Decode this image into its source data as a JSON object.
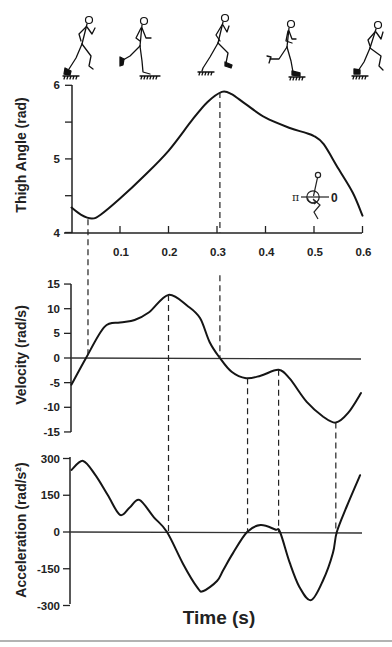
{
  "figure": {
    "xlabel": "Time (s)",
    "inset_icon": {
      "name": "thigh-angle-convention-icon",
      "left_label": "π",
      "right_label": "0"
    },
    "runner_phases": [
      "runner-phase-1",
      "runner-phase-2",
      "runner-phase-3",
      "runner-phase-4",
      "runner-phase-5"
    ]
  },
  "chart_data": [
    {
      "id": "thigh_angle",
      "type": "line",
      "title": "",
      "xlabel": "Time (s)",
      "ylabel": "Thigh Angle (rad)",
      "xlim": [
        0,
        0.6
      ],
      "ylim": [
        4,
        6
      ],
      "xticks": [
        "0.1",
        "0.2",
        "0.3",
        "0.4",
        "0.5",
        "0.6"
      ],
      "xtick_values": [
        0.1,
        0.2,
        0.3,
        0.4,
        0.5,
        0.6
      ],
      "yticks": [
        "6",
        "5",
        "4"
      ],
      "ytick_values": [
        6,
        5,
        4
      ],
      "yminor_values": [
        5.5,
        4.5
      ],
      "grid": false,
      "zero_line": false,
      "series": [
        {
          "name": "Thigh Angle",
          "x": [
            0,
            0.02,
            0.042,
            0.06,
            0.1,
            0.15,
            0.2,
            0.25,
            0.28,
            0.31,
            0.33,
            0.36,
            0.4,
            0.45,
            0.48,
            0.5,
            0.52,
            0.55,
            0.58,
            0.6
          ],
          "values": [
            4.34,
            4.24,
            4.19,
            4.24,
            4.46,
            4.77,
            5.11,
            5.54,
            5.77,
            5.91,
            5.88,
            5.74,
            5.56,
            5.42,
            5.36,
            5.31,
            5.2,
            4.87,
            4.54,
            4.23
          ]
        }
      ]
    },
    {
      "id": "velocity",
      "type": "line",
      "title": "",
      "xlabel": "Time (s)",
      "ylabel": "Velocity (rad/s)",
      "xlim": [
        0,
        0.6
      ],
      "ylim": [
        -15,
        15
      ],
      "yticks": [
        "15",
        "10",
        "5",
        "0",
        "-5",
        "-10",
        "-15"
      ],
      "ytick_values": [
        15,
        10,
        5,
        0,
        -5,
        -10,
        -15
      ],
      "grid": false,
      "zero_line": true,
      "series": [
        {
          "name": "Velocity",
          "x": [
            0,
            0.03,
            0.068,
            0.1,
            0.13,
            0.16,
            0.2,
            0.24,
            0.265,
            0.285,
            0.306,
            0.33,
            0.36,
            0.39,
            0.427,
            0.45,
            0.485,
            0.519,
            0.545,
            0.57,
            0.597
          ],
          "values": [
            -5.4,
            0,
            6.3,
            7.2,
            7.7,
            9.3,
            12.8,
            10.5,
            8.1,
            3.2,
            0,
            -2.8,
            -4.1,
            -3.6,
            -2.4,
            -4.2,
            -8.9,
            -11.9,
            -13.1,
            -11.2,
            -7.1
          ]
        }
      ]
    },
    {
      "id": "acceleration",
      "type": "line",
      "title": "",
      "xlabel": "Time (s)",
      "ylabel": "Acceleration (rad/s²)",
      "xlim": [
        0,
        0.6
      ],
      "ylim": [
        -300,
        300
      ],
      "yticks": [
        "300",
        "150",
        "0",
        "-150",
        "-300"
      ],
      "ytick_values": [
        300,
        150,
        0,
        -150,
        -300
      ],
      "grid": false,
      "zero_line": true,
      "series": [
        {
          "name": "Acceleration",
          "x": [
            0,
            0.024,
            0.05,
            0.075,
            0.1,
            0.12,
            0.14,
            0.17,
            0.197,
            0.23,
            0.26,
            0.272,
            0.3,
            0.313,
            0.333,
            0.362,
            0.39,
            0.42,
            0.43,
            0.45,
            0.47,
            0.494,
            0.519,
            0.539,
            0.547,
            0.567,
            0.595
          ],
          "values": [
            253,
            290,
            230,
            150,
            70,
            100,
            131,
            60,
            0,
            -130,
            -228,
            -241,
            -200,
            -155,
            -86,
            0,
            28,
            10,
            0,
            -126,
            -224,
            -278,
            -196,
            -86,
            0,
            102,
            232
          ]
        }
      ]
    }
  ],
  "event_markers": [
    {
      "t": 0.034,
      "from": {
        "chart": "thigh_angle",
        "value": 4.18
      },
      "to": {
        "chart": "velocity",
        "value": 0.3
      }
    },
    {
      "t": 0.306,
      "from": {
        "chart": "thigh_angle",
        "value": 5.91
      },
      "to": {
        "chart": "thigh_angle",
        "value": 4.0
      }
    },
    {
      "t": 0.306,
      "from": {
        "chart": "velocity",
        "value": 16.8
      },
      "to": {
        "chart": "velocity",
        "value": 0
      }
    },
    {
      "t": 0.2,
      "from": {
        "chart": "velocity",
        "value": 12.8
      },
      "to": {
        "chart": "acceleration",
        "value": 0
      }
    },
    {
      "t": 0.363,
      "from": {
        "chart": "velocity",
        "value": -4.1
      },
      "to": {
        "chart": "acceleration",
        "value": 0
      }
    },
    {
      "t": 0.427,
      "from": {
        "chart": "velocity",
        "value": -2.4
      },
      "to": {
        "chart": "acceleration",
        "value": 0
      }
    },
    {
      "t": 0.545,
      "from": {
        "chart": "velocity",
        "value": -13.1
      },
      "to": {
        "chart": "acceleration",
        "value": 0
      }
    }
  ]
}
